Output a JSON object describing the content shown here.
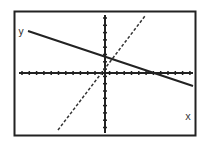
{
  "chart_data": {
    "type": "line",
    "title": "",
    "xlabel": "x",
    "ylabel": "y",
    "grid": false,
    "axis_ticks": {
      "x_ticks": 24,
      "y_ticks": 16
    },
    "series": [
      {
        "name": "solid line",
        "style": "solid",
        "slope": "negative",
        "points": [
          [
            -7.5,
            4.2
          ],
          [
            8.5,
            -1.2
          ]
        ]
      },
      {
        "name": "dashed line",
        "style": "dashed",
        "slope": "positive",
        "points": [
          [
            -4.5,
            -5.7
          ],
          [
            3.7,
            5.7
          ]
        ]
      }
    ],
    "intersection_approx": [
      0.8,
      1.6
    ]
  },
  "labels": {
    "x_axis": "x",
    "y_axis": "y"
  },
  "colors": {
    "ink": "#222222",
    "background": "#ffffff"
  }
}
